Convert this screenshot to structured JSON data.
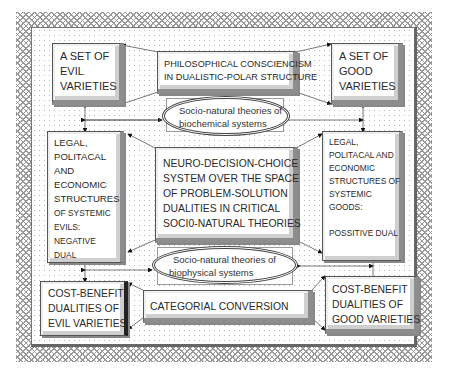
{
  "diagram": {
    "top_left": {
      "lines": [
        "A SET OF",
        "EVIL",
        "VARIETIES"
      ]
    },
    "top_center": {
      "lines": [
        "PHILOSOPHICAL CONSCIENCISM",
        "IN DUALISTIC-POLAR STRUCTURE"
      ]
    },
    "top_right": {
      "lines": [
        "A SET OF",
        "GOOD",
        "VARIETIES"
      ]
    },
    "ellipse_top": {
      "lines": [
        "Socio-natural theories of",
        "biochemical systems"
      ]
    },
    "middle_left": {
      "lines": [
        "LEGAL,",
        "POLITACAL",
        "AND",
        "ECONOMIC",
        "STRUCTURES",
        "OF SYSTEMIC",
        "EVILS:",
        "NEGATIVE",
        "DUAL"
      ]
    },
    "center": {
      "lines": [
        "NEURO-DECISION-CHOICE",
        "SYSTEM OVER THE SPACE",
        "OF PROBLEM-SOLUTION",
        "DUALITIES IN CRITICAL",
        "SOCI0-NATURAL THEORIES"
      ]
    },
    "middle_right": {
      "lines": [
        "LEGAL,",
        "POLITACAL AND",
        "ECONOMIC",
        "STRUCTURES OF",
        "SYSTEMIC",
        "GOODS:",
        "",
        "POSSITIVE DUAL"
      ]
    },
    "ellipse_bottom": {
      "lines": [
        "Socio-natural theories of",
        "biophysical systems"
      ]
    },
    "bottom_left": {
      "lines": [
        "COST-BENEFIT",
        "DUALITIES OF",
        "EVIL VARIETIES"
      ]
    },
    "bottom_center": {
      "lines": [
        "CATEGORIAL CONVERSION"
      ]
    },
    "bottom_right": {
      "lines": [
        "COST-BENEFIT",
        "DUALITIES OF",
        "GOOD VARIETIES"
      ]
    }
  },
  "colors": {
    "border": "#555555",
    "hatch": "#9a9a9a",
    "dots": "#b8b8b8"
  }
}
